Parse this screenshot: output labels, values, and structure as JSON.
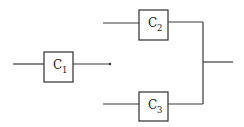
{
  "diagram": {
    "type": "block-diagram",
    "components": [
      {
        "id": "c1",
        "label": "C",
        "subscript": "1"
      },
      {
        "id": "c2",
        "label": "C",
        "subscript": "2"
      },
      {
        "id": "c3",
        "label": "C",
        "subscript": "3"
      }
    ],
    "colors": {
      "line": "#3a3a3a",
      "box_stroke": "#2e2e2e",
      "background": "#ffffff"
    }
  }
}
